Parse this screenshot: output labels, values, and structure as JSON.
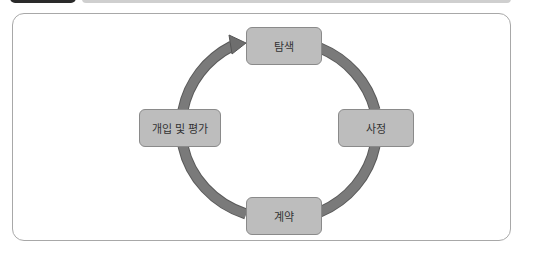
{
  "header": {
    "tab_color": "#2a2a2a",
    "bar_color": "#cfcfcf"
  },
  "diagram": {
    "type": "cycle",
    "direction": "clockwise",
    "arrow_color": "#7a7a7a",
    "node_fill": "#bdbdbd",
    "nodes": [
      {
        "id": "top",
        "label": "탐색"
      },
      {
        "id": "right",
        "label": "사정"
      },
      {
        "id": "bottom",
        "label": "계약"
      },
      {
        "id": "left",
        "label": "개입 및 평가"
      }
    ],
    "edges": [
      {
        "from": "left",
        "to": "top",
        "arrowhead": true
      },
      {
        "from": "top",
        "to": "right",
        "arrowhead": false
      },
      {
        "from": "right",
        "to": "bottom",
        "arrowhead": false
      },
      {
        "from": "bottom",
        "to": "left",
        "arrowhead": false
      }
    ]
  }
}
